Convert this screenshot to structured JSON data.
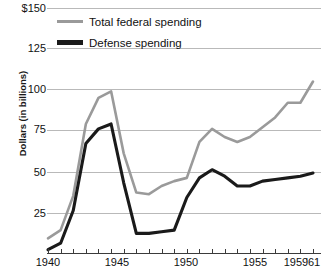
{
  "axes": {
    "y_label": "Dollars (in billions)",
    "y_ticks": [
      "$150",
      "125",
      "100",
      "75",
      "50",
      "25"
    ],
    "x_ticks": [
      "1940",
      "1945",
      "1950",
      "1955",
      "1959",
      "'61"
    ]
  },
  "legend": {
    "items": [
      {
        "label": "Total federal spending",
        "color": "#9a9a9a"
      },
      {
        "label": "Defense spending",
        "color": "#1a1a1a"
      }
    ]
  },
  "chart_data": {
    "type": "line",
    "title": "",
    "xlabel": "",
    "ylabel": "Dollars (in billions)",
    "xlim": [
      1940,
      1961
    ],
    "ylim": [
      0,
      150
    ],
    "grid": true,
    "legend_position": "top-left",
    "x": [
      1940,
      1941,
      1942,
      1943,
      1944,
      1945,
      1946,
      1947,
      1948,
      1949,
      1950,
      1951,
      1952,
      1953,
      1954,
      1955,
      1956,
      1957,
      1958,
      1959,
      1960,
      1961
    ],
    "series": [
      {
        "name": "Total federal spending",
        "color": "#9a9a9a",
        "values": [
          9,
          14,
          35,
          79,
          95,
          99,
          61,
          37,
          36,
          41,
          44,
          46,
          68,
          76,
          71,
          68,
          71,
          77,
          83,
          92,
          92,
          105
        ]
      },
      {
        "name": "Defense spending",
        "color": "#1a1a1a",
        "values": [
          2,
          6,
          26,
          67,
          76,
          79,
          43,
          12,
          12,
          13,
          14,
          34,
          46,
          51,
          47,
          41,
          41,
          44,
          45,
          46,
          47,
          49
        ]
      }
    ]
  }
}
